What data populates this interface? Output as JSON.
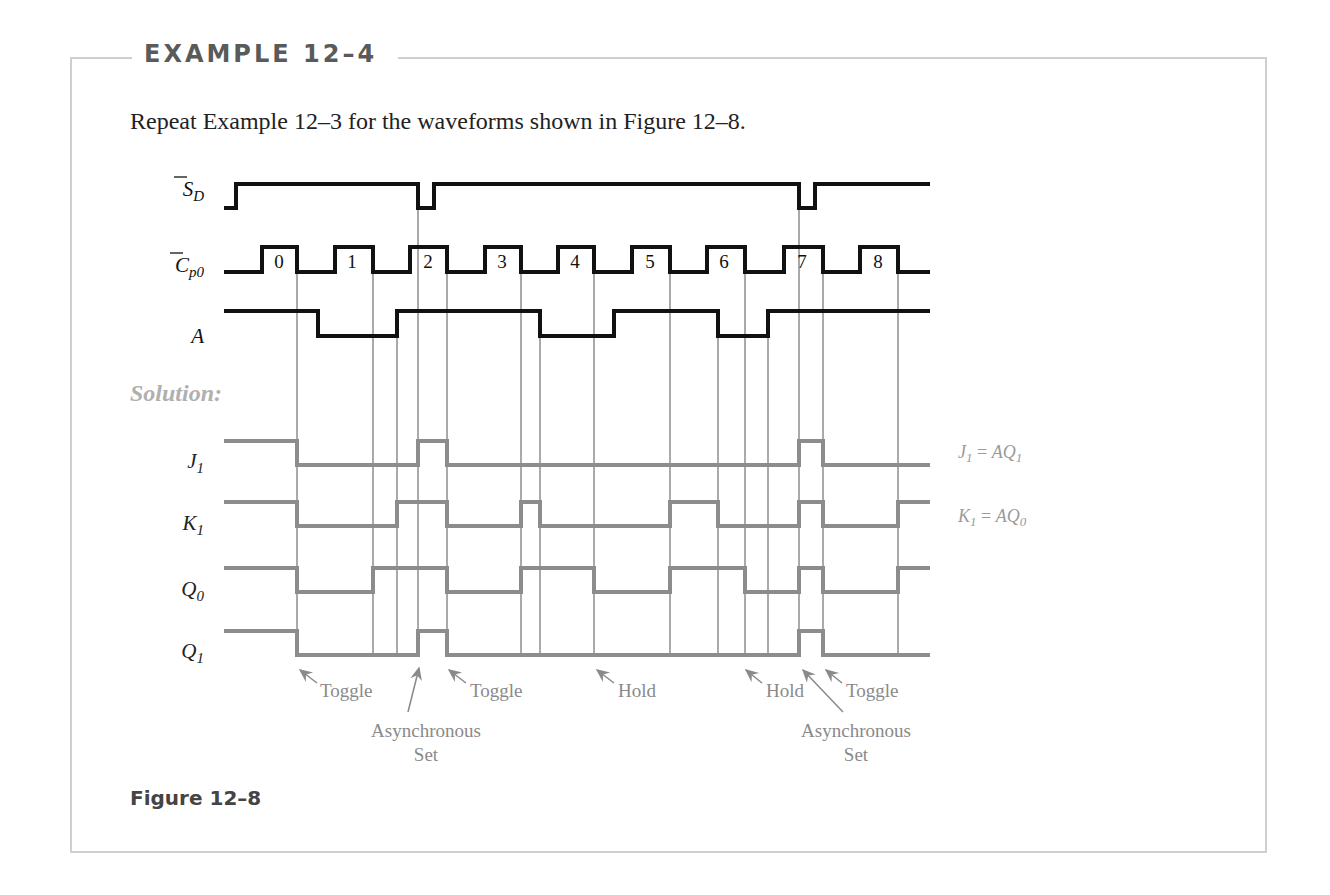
{
  "header": {
    "title": "EXAMPLE 12–4"
  },
  "prompt": "Repeat Example 12–3 for the waveforms shown in Figure 12–8.",
  "solution_label": "Solution:",
  "caption": "Figure 12–8",
  "colors": {
    "input_wave": "#111111",
    "output_wave": "#8c8c8c",
    "guide": "#555555",
    "frame": "#cfcfcf",
    "note": "#8a8a8a"
  },
  "signals": {
    "inputs": [
      {
        "name": "S_D",
        "base": "S",
        "sub": "D",
        "overbar": true,
        "label_y": 196,
        "high": 184,
        "low": 208,
        "x0": 224,
        "x1": 930,
        "start": 0,
        "transitions": [
          236,
          418,
          434,
          799,
          815
        ]
      },
      {
        "name": "Cp0",
        "base": "C",
        "sub": "p0",
        "overbar": true,
        "label_y": 272,
        "high": 247,
        "low": 272,
        "x0": 224,
        "x1": 930,
        "start": 0,
        "transitions": [
          262,
          297,
          335,
          373,
          410,
          447,
          485,
          521,
          558,
          594,
          632,
          670,
          707,
          745,
          784,
          823,
          860,
          898
        ]
      },
      {
        "name": "A",
        "base": "A",
        "sub": "",
        "overbar": false,
        "label_y": 343,
        "high": 311,
        "low": 336,
        "x0": 224,
        "x1": 930,
        "start": 1,
        "transitions": [
          318,
          397,
          540,
          614,
          718,
          768
        ]
      }
    ],
    "outputs": [
      {
        "name": "J1",
        "base": "J",
        "sub": "1",
        "label_y": 468,
        "high": 441,
        "low": 465,
        "x0": 224,
        "x1": 930,
        "start": 1,
        "transitions": [
          297,
          418,
          447,
          799,
          823
        ]
      },
      {
        "name": "K1",
        "base": "K",
        "sub": "1",
        "label_y": 530,
        "high": 502,
        "low": 526,
        "x0": 224,
        "x1": 930,
        "start": 1,
        "transitions": [
          297,
          397,
          447,
          521,
          540,
          670,
          718,
          799,
          823,
          898
        ]
      },
      {
        "name": "Q0",
        "base": "Q",
        "sub": "0",
        "label_y": 596,
        "high": 568,
        "low": 592,
        "x0": 224,
        "x1": 930,
        "start": 1,
        "transitions": [
          297,
          373,
          447,
          521,
          594,
          670,
          745,
          799,
          823,
          898
        ]
      },
      {
        "name": "Q1",
        "base": "Q",
        "sub": "1",
        "label_y": 658,
        "high": 631,
        "low": 655,
        "x0": 224,
        "x1": 930,
        "start": 1,
        "transitions": [
          297,
          418,
          447,
          799,
          823
        ]
      }
    ]
  },
  "clock_pulse_numbers": [
    {
      "label": "0",
      "x": 279
    },
    {
      "label": "1",
      "x": 352
    },
    {
      "label": "2",
      "x": 428
    },
    {
      "label": "3",
      "x": 502
    },
    {
      "label": "4",
      "x": 575
    },
    {
      "label": "5",
      "x": 650
    },
    {
      "label": "6",
      "x": 724
    },
    {
      "label": "7",
      "x": 802
    },
    {
      "label": "8",
      "x": 878
    }
  ],
  "guide_lines": [
    {
      "x": 297,
      "y0": 272
    },
    {
      "x": 373,
      "y0": 272
    },
    {
      "x": 397,
      "y0": 336
    },
    {
      "x": 418,
      "y0": 208
    },
    {
      "x": 447,
      "y0": 272
    },
    {
      "x": 521,
      "y0": 272
    },
    {
      "x": 540,
      "y0": 336
    },
    {
      "x": 594,
      "y0": 272
    },
    {
      "x": 670,
      "y0": 272
    },
    {
      "x": 718,
      "y0": 336
    },
    {
      "x": 745,
      "y0": 272
    },
    {
      "x": 768,
      "y0": 336
    },
    {
      "x": 799,
      "y0": 208
    },
    {
      "x": 823,
      "y0": 272
    },
    {
      "x": 898,
      "y0": 272
    }
  ],
  "guide_bottom": 655,
  "equations": [
    {
      "lhs": "J",
      "lhs_sub": "1",
      "rhs": "AQ",
      "rhs_sub": "1",
      "x": 958,
      "y": 458
    },
    {
      "lhs": "K",
      "lhs_sub": "1",
      "rhs": "AQ",
      "rhs_sub": "0",
      "x": 958,
      "y": 522
    }
  ],
  "annotations": [
    {
      "text": "Toggle",
      "lines": [
        "Toggle"
      ],
      "text_x": 320,
      "text_y": 697,
      "arrow": [
        317,
        683,
        300,
        670
      ]
    },
    {
      "text": "Asynchronous Set",
      "lines": [
        "Asynchronous",
        "Set"
      ],
      "text_x": 426,
      "text_y": 737,
      "arrow": [
        408,
        712,
        419,
        668
      ],
      "center": true
    },
    {
      "text": "Toggle",
      "lines": [
        "Toggle"
      ],
      "text_x": 470,
      "text_y": 697,
      "arrow": [
        466,
        683,
        449,
        670
      ]
    },
    {
      "text": "Hold",
      "lines": [
        "Hold"
      ],
      "text_x": 618,
      "text_y": 697,
      "arrow": [
        614,
        683,
        597,
        670
      ]
    },
    {
      "text": "Hold",
      "lines": [
        "Hold"
      ],
      "text_x": 766,
      "text_y": 697,
      "arrow": [
        762,
        683,
        746,
        670
      ]
    },
    {
      "text": "Toggle",
      "lines": [
        "Toggle"
      ],
      "text_x": 846,
      "text_y": 697,
      "arrow": [
        842,
        683,
        826,
        670
      ]
    },
    {
      "text": "Asynchronous Set",
      "lines": [
        "Asynchronous",
        "Set"
      ],
      "text_x": 856,
      "text_y": 737,
      "arrow": [
        843,
        712,
        803,
        670
      ],
      "center": true
    }
  ]
}
